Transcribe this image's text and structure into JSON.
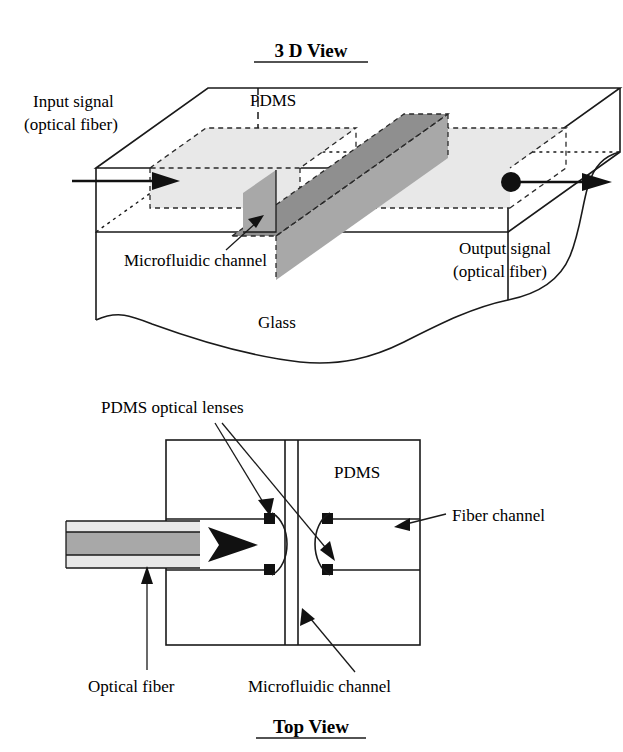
{
  "view_3d": {
    "title": "3 D View",
    "labels": {
      "input_signal_line1": "Input signal",
      "input_signal_line2": "(optical fiber)",
      "output_signal_line1": "Output signal",
      "output_signal_line2": "(optical fiber)",
      "pdms": "PDMS",
      "glass": "Glass",
      "microfluidic_channel": "Microfluidic channel"
    }
  },
  "view_top": {
    "title": "Top View",
    "labels": {
      "pdms_optical_lenses": "PDMS optical lenses",
      "pdms": "PDMS",
      "fiber_channel": "Fiber channel",
      "optical_fiber": "Optical fiber",
      "microfluidic_channel": "Microfluidic channel"
    }
  },
  "colors": {
    "ink": "#1a1a1a",
    "background": "#ffffff",
    "fiber_channel_fill": "#e8e8e8",
    "microfluidic_fill": "#a8a8a8",
    "fiber_core_fill": "#a8a8a8",
    "fiber_cladding_fill": "#e8e8e8",
    "lens_marker": "#111111"
  }
}
